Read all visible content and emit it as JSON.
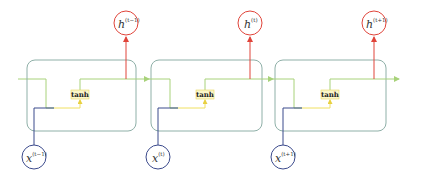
{
  "diagram": {
    "type": "unrolled-rnn",
    "colors": {
      "cell_border": "#8fb0a8",
      "hidden_flow": "#a8d27a",
      "input_flow": "#3b4a8c",
      "activation_flow": "#f0e060",
      "output_flow": "#e0443a",
      "input_circle": "#3b4a8c",
      "output_circle": "#e0443a",
      "tanh_box_fill": "#fbf6c8",
      "tanh_box_border": "#e8d860"
    },
    "cells": [
      {
        "activation": "tanh",
        "input": {
          "base": "x",
          "sup": "(t−1)"
        },
        "output": {
          "base": "h",
          "sup": "(t−1)"
        }
      },
      {
        "activation": "tanh",
        "input": {
          "base": "x",
          "sup": "(t)"
        },
        "output": {
          "base": "h",
          "sup": "(t)"
        }
      },
      {
        "activation": "tanh",
        "input": {
          "base": "x",
          "sup": "(t+1)"
        },
        "output": {
          "base": "h",
          "sup": "(t+1)"
        }
      }
    ]
  }
}
